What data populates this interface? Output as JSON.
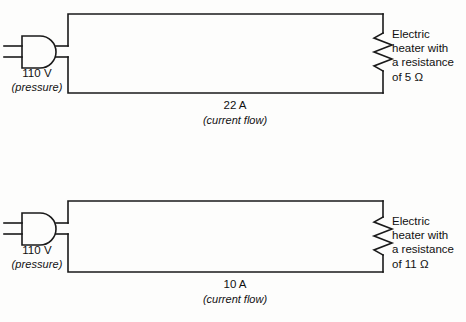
{
  "diagram": {
    "type": "electrical-circuit-comparison",
    "background_color": "#fdfdfc",
    "line_color": "#1a1a1a",
    "circuits": [
      {
        "id": "top",
        "source": {
          "symbol": "plug-icon",
          "voltage": "110 V",
          "voltage_note": "(pressure)"
        },
        "current": {
          "value": "22 A",
          "note": "(current flow)"
        },
        "load": {
          "symbol": "resistor-icon",
          "lines": [
            "Electric",
            "heater with",
            "a resistance",
            "of 5 Ω"
          ]
        }
      },
      {
        "id": "bottom",
        "source": {
          "symbol": "plug-icon",
          "voltage": "110 V",
          "voltage_note": "(pressure)"
        },
        "current": {
          "value": "10 A",
          "note": "(current flow)"
        },
        "load": {
          "symbol": "resistor-icon",
          "lines": [
            "Electric",
            "heater with",
            "a resistance",
            "of 11 Ω"
          ]
        }
      }
    ]
  }
}
